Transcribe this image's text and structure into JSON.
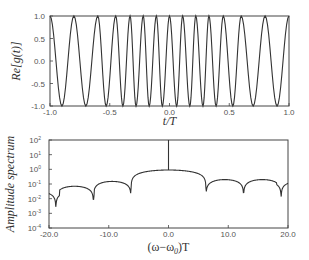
{
  "chart_data": [
    {
      "type": "line",
      "title": "",
      "xlabel": "t/T",
      "ylabel": "Re[g(t)]",
      "xlim": [
        -1.0,
        1.0
      ],
      "ylim": [
        -1.0,
        1.0
      ],
      "xticks": [
        -1.0,
        -0.5,
        0.0,
        0.5,
        1.0
      ],
      "xtick_labels": [
        "-1.0",
        "-0.5",
        "0.0",
        "0.5",
        "1.0"
      ],
      "yticks": [
        -1.0,
        -0.5,
        0.0,
        0.5,
        1.0
      ],
      "ytick_labels": [
        "-1.0",
        "-0.5",
        "0.0",
        "0.5",
        "1.0"
      ],
      "grid": false,
      "legend": null,
      "description": "Oscillating cosine with varying period; maxima at +1.0, minima at -1.0",
      "peaks_t": [
        -1.0,
        -0.8,
        -0.6,
        -0.45,
        -0.33,
        -0.22,
        -0.11,
        0.0,
        0.11,
        0.22,
        0.33,
        0.45,
        0.6,
        0.8,
        1.0
      ],
      "troughs_t": [
        -0.9,
        -0.7,
        -0.53,
        -0.39,
        -0.28,
        -0.17,
        -0.06,
        0.06,
        0.17,
        0.28,
        0.39,
        0.53,
        0.7,
        0.9
      ],
      "series": [
        {
          "name": "Re[g(t)]",
          "color": "#333333"
        }
      ]
    },
    {
      "type": "line",
      "title": "",
      "xlabel": "(ω−ω0)T",
      "ylabel": "Amplitude spectrum",
      "yscale": "log",
      "xlim": [
        -20.0,
        20.0
      ],
      "ylim": [
        0.0001,
        100
      ],
      "xticks": [
        -20.0,
        -10.0,
        0.0,
        10.0,
        20.0
      ],
      "xtick_labels": [
        "-20.0",
        "-10.0",
        "0.0",
        "10.0",
        "20.0"
      ],
      "yticks": [
        0.0001,
        0.001,
        0.01,
        0.1,
        1,
        10,
        100
      ],
      "ytick_labels": [
        [
          "10",
          "-4"
        ],
        [
          "10",
          "-3"
        ],
        [
          "10",
          "-2"
        ],
        [
          "10",
          "-1"
        ],
        [
          "10",
          "0"
        ],
        [
          "10",
          "1"
        ],
        [
          "10",
          "2"
        ]
      ],
      "grid": false,
      "legend": null,
      "description": "Sinc-like amplitude spectrum with nulls at multiples of 2π and a delta spike at 0",
      "main_lobe_peak": 0.9,
      "spike": {
        "x": 0.0,
        "value": 100
      },
      "nulls_x": [
        -18.85,
        -12.57,
        -6.28,
        6.28,
        12.57,
        18.85
      ],
      "null_depth": 0.0003,
      "side_lobes": [
        {
          "x": -21.0,
          "value": 0.03
        },
        {
          "x": -15.5,
          "value": 0.07
        },
        {
          "x": -9.4,
          "value": 0.15
        },
        {
          "x": 9.4,
          "value": 0.2
        },
        {
          "x": 15.7,
          "value": 0.2
        },
        {
          "x": 20.5,
          "value": 0.15
        }
      ],
      "series": [
        {
          "name": "Amplitude spectrum",
          "color": "#333333"
        }
      ]
    }
  ],
  "layout": {
    "top_plot": {
      "left": 50,
      "right": 289,
      "top": 16,
      "bottom": 106
    },
    "bottom_plot": {
      "left": 49,
      "right": 288,
      "top": 140,
      "bottom": 228
    }
  },
  "labels": {
    "top_xlabel": "t/T",
    "top_ylabel": "Re[g(t)]",
    "bottom_xlabel_main": "(ω−ω",
    "bottom_xlabel_sub": "0",
    "bottom_xlabel_tail": ")T",
    "bottom_ylabel": "Amplitude spectrum"
  }
}
